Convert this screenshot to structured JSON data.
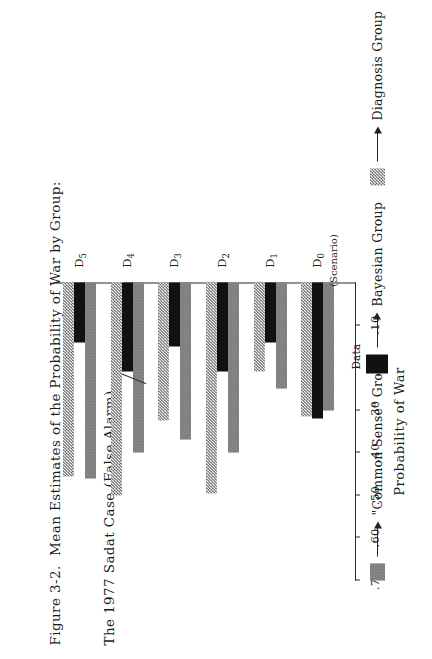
{
  "figure": {
    "caption_line1": "Figure 3-2.  Mean Estimates of the Probability of War by Group:",
    "caption_line2": "The 1977 Sadat Case (False Alarm)",
    "axis_title": "Probability of War"
  },
  "legend": {
    "common_sense": "\"Common Sense\" Group",
    "data": "Data",
    "bayesian": "Bayesian Group",
    "diagnosis": "Diagnosis Group"
  },
  "chart_data": {
    "type": "bar",
    "orientation": "horizontal",
    "title": "Figure 3-2.  Mean Estimates of the Probability of War by Group: The 1977 Sadat Case (False Alarm)",
    "xlabel": "Probability of War",
    "ylabel": "",
    "xlim": [
      0,
      0.7
    ],
    "grid": false,
    "legend_position": "bottom",
    "tick_labels": [
      ".70",
      ".60",
      ".50",
      ".40",
      ".30",
      ".20",
      ".10"
    ],
    "tick_values": [
      0.7,
      0.6,
      0.5,
      0.4,
      0.3,
      0.2,
      0.1
    ],
    "categories": [
      "D0",
      "D1",
      "D2",
      "D3",
      "D4",
      "D5"
    ],
    "category_labels": [
      "D",
      "D",
      "D",
      "D",
      "D",
      "D"
    ],
    "category_subscripts": [
      "0",
      "1",
      "2",
      "3",
      "4",
      "5"
    ],
    "category_note": "(Scenario)",
    "series": [
      {
        "name": "\"Common Sense\" Group",
        "pattern": "gray-checker",
        "color": "#8f8f8f",
        "values": [
          0.3,
          0.25,
          0.4,
          0.37,
          0.4,
          0.46
        ]
      },
      {
        "name": "Data",
        "pattern": "solid-black",
        "color": "#111111",
        "values": [
          0.32,
          0.14,
          0.21,
          0.15,
          0.21,
          0.14
        ]
      },
      {
        "name": "Bayesian Group / Diagnosis Group",
        "pattern": "light-checker",
        "color": "#efefef",
        "values": [
          0.315,
          0.21,
          0.495,
          0.325,
          0.5,
          0.455
        ]
      }
    ]
  }
}
